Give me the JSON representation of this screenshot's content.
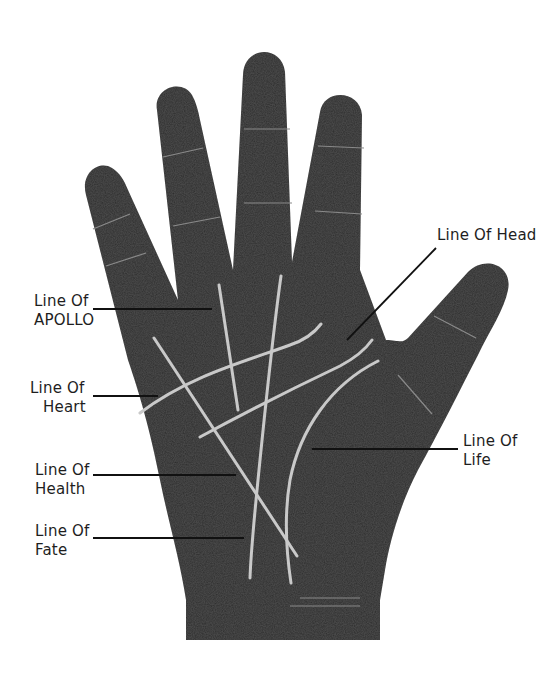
{
  "diagram": {
    "colors": {
      "background": "#ffffff",
      "hand": "#2f2f2f",
      "palm_line": "#c9c9c9",
      "leader_line": "#111111",
      "text": "#1e1e1e"
    },
    "labels": [
      {
        "id": "apollo",
        "line1": "Line Of",
        "line2": "APOLLO"
      },
      {
        "id": "heart",
        "line1": "Line Of",
        "line2": "Heart"
      },
      {
        "id": "health",
        "line1": "Line Of",
        "line2": "Health"
      },
      {
        "id": "fate",
        "line1": "Line Of",
        "line2": "Fate"
      },
      {
        "id": "head",
        "line1": "Line Of Head",
        "line2": ""
      },
      {
        "id": "life",
        "line1": "Line Of",
        "line2": "Life"
      }
    ]
  }
}
